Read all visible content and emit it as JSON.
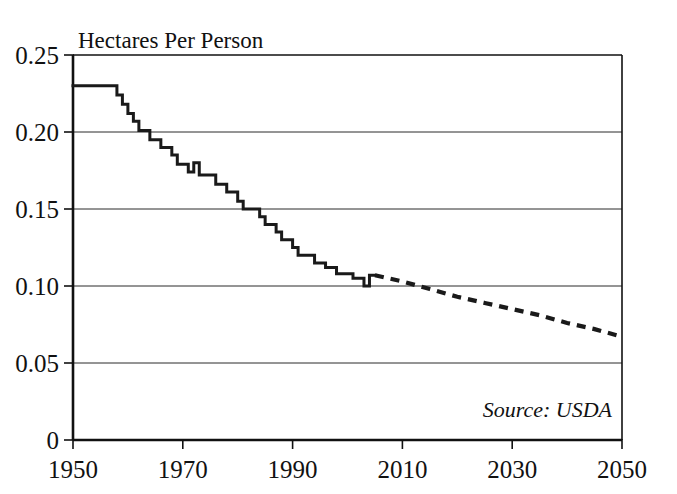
{
  "chart_data": {
    "type": "line",
    "title": "Hectares Per Person",
    "xlabel": "",
    "ylabel": "Hectares Per Person",
    "xlim": [
      1950,
      2050
    ],
    "ylim": [
      0,
      0.25
    ],
    "grid": true,
    "legend": null,
    "annotations": [
      {
        "name": "source-note",
        "text": "Source: USDA",
        "position": "bottom-right",
        "style": "italic"
      }
    ],
    "y_ticks": [
      "0",
      "0.05",
      "0.10",
      "0.15",
      "0.20",
      "0.25"
    ],
    "y_tick_values": [
      0,
      0.05,
      0.1,
      0.15,
      0.2,
      0.25
    ],
    "x_ticks": [
      "1950",
      "1970",
      "1990",
      "2010",
      "2030",
      "2050"
    ],
    "x_tick_values": [
      1950,
      1970,
      1990,
      2010,
      2030,
      2050
    ],
    "series": [
      {
        "name": "Grain area per person (historical)",
        "style": "solid",
        "color": "#1a1a1a",
        "x": [
          1950,
          1951,
          1952,
          1953,
          1954,
          1955,
          1956,
          1957,
          1958,
          1959,
          1960,
          1961,
          1962,
          1963,
          1964,
          1965,
          1966,
          1967,
          1968,
          1969,
          1970,
          1971,
          1972,
          1973,
          1974,
          1975,
          1976,
          1977,
          1978,
          1979,
          1980,
          1981,
          1982,
          1983,
          1984,
          1985,
          1986,
          1987,
          1988,
          1989,
          1990,
          1991,
          1992,
          1993,
          1994,
          1995,
          1996,
          1997,
          1998,
          1999,
          2000,
          2001,
          2002,
          2003,
          2004,
          2005
        ],
        "values": [
          0.23,
          0.23,
          0.23,
          0.23,
          0.23,
          0.23,
          0.23,
          0.23,
          0.224,
          0.218,
          0.212,
          0.207,
          0.201,
          0.201,
          0.195,
          0.195,
          0.19,
          0.19,
          0.185,
          0.179,
          0.179,
          0.174,
          0.18,
          0.172,
          0.172,
          0.172,
          0.166,
          0.166,
          0.161,
          0.161,
          0.155,
          0.15,
          0.15,
          0.15,
          0.145,
          0.14,
          0.14,
          0.135,
          0.13,
          0.13,
          0.125,
          0.12,
          0.12,
          0.12,
          0.115,
          0.115,
          0.112,
          0.112,
          0.108,
          0.108,
          0.108,
          0.105,
          0.105,
          0.1,
          0.107,
          0.107
        ]
      },
      {
        "name": "Projection",
        "style": "dotted",
        "color": "#1a1a1a",
        "x": [
          2005,
          2010,
          2015,
          2020,
          2025,
          2030,
          2035,
          2040,
          2045,
          2050
        ],
        "values": [
          0.107,
          0.103,
          0.098,
          0.093,
          0.089,
          0.085,
          0.081,
          0.076,
          0.072,
          0.067
        ]
      }
    ]
  },
  "figure": {
    "title": "Hectares Per Person",
    "source": "Source: USDA"
  }
}
